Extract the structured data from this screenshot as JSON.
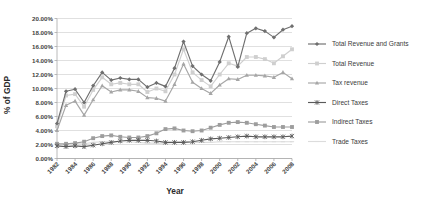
{
  "chart_data": {
    "type": "line",
    "title": "",
    "xlabel": "Year",
    "ylabel": "% of GDP",
    "ylim": [
      0,
      20
    ],
    "ytick_labels": [
      "0.00%",
      "2.00%",
      "4.00%",
      "6.00%",
      "8.00%",
      "10.00%",
      "12.00%",
      "14.00%",
      "16.00%",
      "18.00%",
      "20.00%"
    ],
    "ytick_values": [
      0,
      2,
      4,
      6,
      8,
      10,
      12,
      14,
      16,
      18,
      20
    ],
    "grid": true,
    "legend_position": "right",
    "x": [
      1982,
      1983,
      1984,
      1985,
      1986,
      1987,
      1988,
      1989,
      1990,
      1991,
      1992,
      1993,
      1994,
      1995,
      1996,
      1997,
      1998,
      1999,
      2000,
      2001,
      2002,
      2003,
      2004,
      2005,
      2006,
      2007,
      2008
    ],
    "xtick_labels": [
      "1982",
      "1984",
      "1986",
      "1988",
      "1990",
      "1992",
      "1994",
      "1996",
      "1998",
      "2000",
      "2002",
      "2004",
      "2006",
      "2008"
    ],
    "xtick_values": [
      1982,
      1984,
      1986,
      1988,
      1990,
      1992,
      1994,
      1996,
      1998,
      2000,
      2002,
      2004,
      2006,
      2008
    ],
    "series": [
      {
        "name": "Total Revenue and Grants",
        "color": "#6f6f6f",
        "marker": "diamond",
        "values": [
          5.0,
          9.6,
          9.9,
          8.0,
          10.4,
          12.3,
          11.2,
          11.5,
          11.3,
          11.3,
          10.2,
          10.8,
          10.3,
          12.9,
          16.7,
          13.2,
          12.0,
          11.1,
          13.8,
          17.4,
          13.1,
          17.9,
          18.6,
          18.2,
          17.3,
          18.4,
          18.9
        ]
      },
      {
        "name": "Total Revenue",
        "color": "#cfcfcf",
        "marker": "square",
        "values": [
          4.6,
          9.0,
          9.2,
          7.4,
          9.8,
          11.6,
          10.6,
          10.8,
          10.6,
          10.6,
          9.5,
          10.0,
          9.6,
          12.0,
          15.6,
          12.3,
          11.2,
          10.3,
          12.0,
          13.6,
          13.2,
          14.5,
          14.5,
          14.2,
          13.6,
          14.6,
          15.6
        ]
      },
      {
        "name": "Tax revenue",
        "color": "#a6a6a6",
        "marker": "triangle",
        "values": [
          4.0,
          7.6,
          8.2,
          6.2,
          8.4,
          10.4,
          9.5,
          9.8,
          9.8,
          9.6,
          8.7,
          8.6,
          8.2,
          10.6,
          13.5,
          10.9,
          10.0,
          9.3,
          10.5,
          11.4,
          11.3,
          11.9,
          11.9,
          11.8,
          11.6,
          12.3,
          11.4
        ]
      },
      {
        "name": "Direct Taxes",
        "color": "#5a5a5a",
        "marker": "star",
        "values": [
          1.8,
          1.7,
          1.8,
          1.7,
          1.9,
          2.1,
          2.3,
          2.5,
          2.6,
          2.6,
          2.6,
          2.5,
          2.3,
          2.3,
          2.3,
          2.4,
          2.6,
          2.8,
          2.9,
          3.0,
          3.1,
          3.2,
          3.1,
          3.1,
          3.1,
          3.1,
          3.2
        ]
      },
      {
        "name": "Indirect Taxes",
        "color": "#9d9d9d",
        "marker": "square",
        "values": [
          2.1,
          2.1,
          2.2,
          2.4,
          2.9,
          3.2,
          3.3,
          3.1,
          3.0,
          3.0,
          3.2,
          3.6,
          4.2,
          4.3,
          4.0,
          3.9,
          4.0,
          4.4,
          4.8,
          5.1,
          5.2,
          5.1,
          4.9,
          4.7,
          4.5,
          4.5,
          4.5
        ]
      },
      {
        "name": "Trade Taxes",
        "color": "#dcdcdc",
        "marker": "line",
        "values": [
          2.0,
          2.0,
          2.1,
          2.1,
          2.3,
          2.4,
          2.4,
          2.4,
          2.4,
          2.3,
          2.2,
          2.2,
          2.2,
          2.3,
          2.4,
          2.3,
          2.3,
          2.3,
          2.4,
          2.4,
          2.4,
          2.4,
          2.4,
          2.4,
          2.4,
          2.4,
          2.4
        ]
      }
    ]
  },
  "legend": {
    "items": [
      {
        "label": "Total Revenue and Grants"
      },
      {
        "label": "Total Revenue"
      },
      {
        "label": "Tax revenue"
      },
      {
        "label": "Direct Taxes"
      },
      {
        "label": "Indirect Taxes"
      },
      {
        "label": "Trade Taxes"
      }
    ]
  }
}
